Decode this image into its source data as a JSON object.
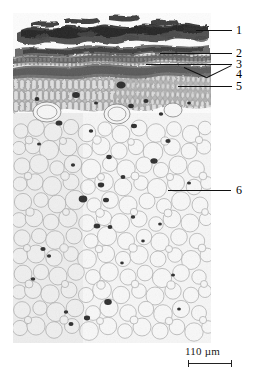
{
  "figure": {
    "kind": "light-micrograph",
    "background_color": "#ffffff",
    "ink_color": "#111111"
  },
  "callouts": [
    {
      "id": "1",
      "label": "1",
      "line_style": "straight"
    },
    {
      "id": "2",
      "label": "2",
      "line_style": "straight"
    },
    {
      "id": "3",
      "label": "3",
      "line_style": "straight"
    },
    {
      "id": "4",
      "label": "4",
      "line_style": "diagonal"
    },
    {
      "id": "5",
      "label": "5",
      "line_style": "straight"
    },
    {
      "id": "6",
      "label": "6",
      "line_style": "straight"
    }
  ],
  "scale_bar": {
    "value": "110",
    "unit": "µm",
    "text": "110 µm"
  },
  "micrograph_layers": [
    {
      "name": "cuticle-wax-flakes",
      "tone": "#3a3a3a"
    },
    {
      "name": "epidermis",
      "tone": "#5a5a5a"
    },
    {
      "name": "hypodermis",
      "tone": "#4e4e4e"
    },
    {
      "name": "sclerenchyma-band",
      "tone": "#6b6b6b"
    },
    {
      "name": "palisade-cortex",
      "tone": "#7a7a7a"
    },
    {
      "name": "parenchyma-pith",
      "tone": "#cfcfcf"
    }
  ]
}
